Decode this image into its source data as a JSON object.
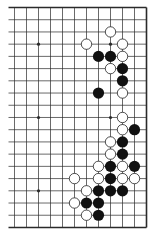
{
  "diagram": {
    "type": "go-board-fragment",
    "visible_columns": 12,
    "visible_rows": 19,
    "board_edges": [
      "top",
      "right",
      "bottom"
    ],
    "colors": {
      "background": "#ffffff",
      "line": "#2a2a2a",
      "black_stone": "#111111",
      "white_stone_fill": "#ffffff",
      "white_stone_stroke": "#222222"
    },
    "geometry": {
      "x0": 14.5,
      "y0": 7.5,
      "dx": 12.0,
      "dy": 12.22,
      "line_extend_left": 6,
      "stone_radius": 5.6,
      "star_radius": 1.6
    },
    "star_points": [
      {
        "col": 2,
        "row": 3
      },
      {
        "col": 8,
        "row": 3
      },
      {
        "col": 2,
        "row": 9
      },
      {
        "col": 8,
        "row": 9
      },
      {
        "col": 2,
        "row": 15
      },
      {
        "col": 8,
        "row": 15
      }
    ],
    "stones": [
      {
        "color": "white",
        "col": 8,
        "row": 2
      },
      {
        "color": "white",
        "col": 6,
        "row": 3
      },
      {
        "color": "white",
        "col": 9,
        "row": 3
      },
      {
        "color": "black",
        "col": 7,
        "row": 4
      },
      {
        "color": "black",
        "col": 8,
        "row": 4
      },
      {
        "color": "white",
        "col": 9,
        "row": 4
      },
      {
        "color": "white",
        "col": 8,
        "row": 5
      },
      {
        "color": "black",
        "col": 9,
        "row": 5
      },
      {
        "color": "black",
        "col": 9,
        "row": 6
      },
      {
        "color": "black",
        "col": 7,
        "row": 7
      },
      {
        "color": "white",
        "col": 9,
        "row": 7
      },
      {
        "color": "white",
        "col": 9,
        "row": 9
      },
      {
        "color": "white",
        "col": 9,
        "row": 10
      },
      {
        "color": "black",
        "col": 10,
        "row": 10
      },
      {
        "color": "white",
        "col": 8,
        "row": 11
      },
      {
        "color": "black",
        "col": 9,
        "row": 11
      },
      {
        "color": "white",
        "col": 8,
        "row": 12
      },
      {
        "color": "black",
        "col": 9,
        "row": 12
      },
      {
        "color": "white",
        "col": 7,
        "row": 13
      },
      {
        "color": "black",
        "col": 8,
        "row": 13
      },
      {
        "color": "white",
        "col": 9,
        "row": 13
      },
      {
        "color": "black",
        "col": 10,
        "row": 13
      },
      {
        "color": "white",
        "col": 5,
        "row": 14
      },
      {
        "color": "white",
        "col": 7,
        "row": 14
      },
      {
        "color": "black",
        "col": 8,
        "row": 14
      },
      {
        "color": "white",
        "col": 9,
        "row": 14
      },
      {
        "color": "white",
        "col": 10,
        "row": 14
      },
      {
        "color": "white",
        "col": 6,
        "row": 15
      },
      {
        "color": "black",
        "col": 7,
        "row": 15
      },
      {
        "color": "black",
        "col": 8,
        "row": 15
      },
      {
        "color": "black",
        "col": 9,
        "row": 15
      },
      {
        "color": "white",
        "col": 5,
        "row": 16
      },
      {
        "color": "black",
        "col": 6,
        "row": 16
      },
      {
        "color": "black",
        "col": 7,
        "row": 16
      },
      {
        "color": "white",
        "col": 6,
        "row": 17
      },
      {
        "color": "black",
        "col": 7,
        "row": 17
      }
    ]
  }
}
